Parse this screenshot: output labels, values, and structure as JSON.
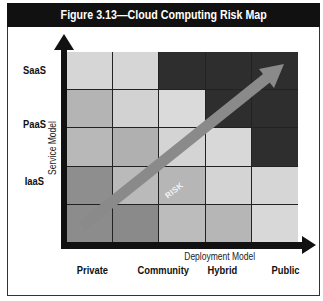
{
  "figure": {
    "title": "Figure 3.13—Cloud Computing Risk Map"
  },
  "axes": {
    "y_title": "Service Model",
    "x_title": "Deployment Model",
    "y_labels": [
      "SaaS",
      "PaaS",
      "IaaS"
    ],
    "x_labels": [
      "Private",
      "Community",
      "Hybrid",
      "Public"
    ]
  },
  "risk_arrow": {
    "label": "RISK",
    "color": "#8a8a8a",
    "direction": "bottom-left to top-right"
  },
  "grid": {
    "rows": 5,
    "cols": 5,
    "cells": [
      [
        "#d6d6d6",
        "#d6d6d6",
        "#2e2e2e",
        "#2e2e2e",
        "#2e2e2e"
      ],
      [
        "#b4b4b4",
        "#d2d2d2",
        "#dadada",
        "#2e2e2e",
        "#2e2e2e"
      ],
      [
        "#b8b8b8",
        "#b0b0b0",
        "#d4d4d4",
        "#d8d8d8",
        "#2e2e2e"
      ],
      [
        "#8e8e8e",
        "#bababa",
        "#b6b6b6",
        "#d4d4d4",
        "#d6d6d6"
      ],
      [
        "#8c8c8c",
        "#8a8a8a",
        "#bcbcbc",
        "#b6b6b6",
        "#d8d8d8"
      ]
    ]
  },
  "colors": {
    "title_bar": "#111111",
    "axis": "#111111",
    "high_risk": "#2e2e2e",
    "low_risk": "#d6d6d6"
  }
}
